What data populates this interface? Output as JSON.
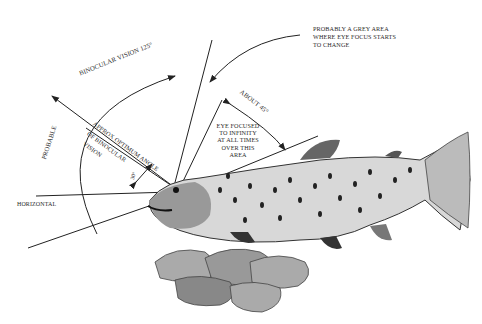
{
  "diagram": {
    "labels": {
      "grey_area": [
        "PROBABLY A GREY AREA",
        "WHERE EYE FOCUS STARTS",
        "TO CHANGE"
      ],
      "binocular_arc": "BINOCULAR VISION 125°",
      "probable": "PROBABLE",
      "optimum_angle_1": "APPROX OPTIMUM ANGLE",
      "optimum_angle_2": "OF BINOCULAR",
      "optimum_angle_3": "VISION",
      "small_angle": "30°",
      "about_45": "ABOUT 45°",
      "eye_focused": [
        "EYE FOCUSED",
        "TO INFINITY",
        "AT ALL TIMES",
        "OVER THIS",
        "AREA"
      ],
      "horizontal": "HORIZONTAL"
    },
    "colors": {
      "ink": "#222222",
      "background": "#ffffff"
    }
  }
}
